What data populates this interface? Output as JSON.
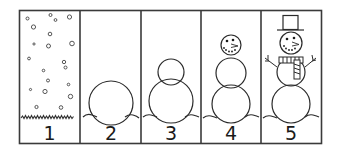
{
  "worksheet": {
    "title": "Build a Snowman sequence",
    "colors": {
      "line": "#2a2a2a",
      "background": "#ffffff",
      "frame": "#3a3a3a"
    },
    "panels": [
      {
        "number": "1",
        "content": "falling snowflakes over grass"
      },
      {
        "number": "2",
        "content": "one snowball on snow"
      },
      {
        "number": "3",
        "content": "two stacked snowballs"
      },
      {
        "number": "4",
        "content": "three snowballs with face"
      },
      {
        "number": "5",
        "content": "snowman with top hat, scarf and stick arms"
      }
    ]
  }
}
